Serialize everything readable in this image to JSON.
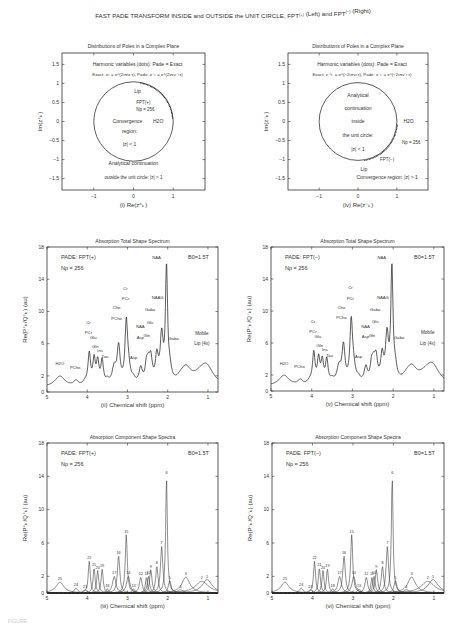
{
  "figure": {
    "title": "FAST PADE TRANSFORM INSIDE and OUTSIDE the UNIT CIRCLE, FPT",
    "title_sup_left": "(+)",
    "title_mid": " (Left) and FPT",
    "title_sup_right": "(−)",
    "title_end": " (Right)",
    "caption_stub": "FIGURE"
  },
  "chart_data": [
    {
      "id": "i",
      "type": "scatter",
      "title": "Distributions of Poles in a Complex Plane",
      "xlabel": "(i)  Re(z⁺ₖ)",
      "ylabel": "Im(z⁺ₖ)",
      "xlim": [
        -1.8,
        1.8
      ],
      "ylim": [
        -1.8,
        1.8
      ],
      "xticks": [
        "−1",
        "0",
        "1"
      ],
      "yticks": [
        "1.5",
        "1",
        "0.5",
        "0",
        "−0.5",
        "−1",
        "−1.5"
      ],
      "annotations": [
        "Harmonic variables (dots):  Pade = Exact",
        "Exact:  zₖ = e^(2iπνₖτ),  Pade:  z⁺ₖ = e^(2iπν⁺ₖτ)",
        "Lip",
        "FPT(+)",
        "Np = 256",
        "H2O",
        "Convergence",
        "region:",
        "|z| < 1",
        "Analytical continuation",
        "outside the unit circle: |z| > 1"
      ],
      "unit_circle": true,
      "poles_arc_deg": [
        5,
        80
      ]
    },
    {
      "id": "iv",
      "type": "scatter",
      "title": "Distributions of Poles in a Complex Plane",
      "xlabel": "(iv)  Re(z⁻ₖ)",
      "ylabel": "Im(z⁻ₖ)",
      "xlim": [
        -1.8,
        1.8
      ],
      "ylim": [
        -1.8,
        1.8
      ],
      "xticks": [
        "−1",
        "0",
        "1"
      ],
      "yticks": [
        "1.5",
        "1",
        "0.5",
        "0",
        "−0.5",
        "−1",
        "−1.5"
      ],
      "annotations": [
        "Harmonic variables (dots):  Pade = Exact",
        "Exact:  z⁻¹ₖ = e^(−2iπνₖτ),  Pade:  z⁻ₖ = e^(−2iπν⁻ₖτ)",
        "Analytical",
        "continuation",
        "inside",
        "the unit circle:",
        "|z| < 1",
        "H2O",
        "Np = 256",
        "FPT(−)",
        "Lip",
        "Convergence region: |z| > 1"
      ],
      "unit_circle": true,
      "poles_arc_deg": [
        -80,
        -5
      ]
    },
    {
      "id": "ii",
      "type": "line",
      "title": "Absorption Total Shape Spectrum",
      "xlabel": "(ii)  Chemical shift (ppm)",
      "ylabel": "Re(P⁺ₖ/Q⁺ₖ) (au)",
      "xlim": [
        5,
        0.75
      ],
      "ylim": [
        0,
        18
      ],
      "xticks": [
        "5",
        "4",
        "3",
        "2",
        "1"
      ],
      "yticks": [
        "18",
        "14",
        "10",
        "6",
        "2",
        "0"
      ],
      "legend_text": [
        "PADE: FPT(+)",
        "Np = 256",
        "B0=1.5T"
      ],
      "peak_labels": [
        "H2O",
        "PCho",
        "Cr PCr",
        "Glu",
        "Gln",
        "Ins",
        "Tau",
        "Cho PCho",
        "Cr PCr",
        "Asp",
        "NAA Asp",
        "Gln",
        "Glu",
        "Gaba",
        "NAAG",
        "NAA",
        "Gaba",
        "Mobile Lip (4x)"
      ],
      "x": [
        5.0,
        4.68,
        4.3,
        3.95,
        3.83,
        3.75,
        3.62,
        3.45,
        3.25,
        3.05,
        2.85,
        2.68,
        2.52,
        2.45,
        2.3,
        2.15,
        2.06,
        1.95,
        1.8,
        1.55,
        1.3,
        1.05,
        0.75
      ],
      "values": [
        1.2,
        2.2,
        1.9,
        5.6,
        5.0,
        4.6,
        4.9,
        3.3,
        7.6,
        9.9,
        3.0,
        4.8,
        5.7,
        5.8,
        6.8,
        10.5,
        17.8,
        5.6,
        3.3,
        4.0,
        3.2,
        4.2,
        2.2
      ]
    },
    {
      "id": "v",
      "type": "line",
      "title": "Absorption Total Shape Spectrum",
      "xlabel": "(v)  Chemical shift (ppm)",
      "ylabel": "Re(P⁻ₖ/Q⁻ₖ) (au)",
      "xlim": [
        5,
        0.75
      ],
      "ylim": [
        0,
        18
      ],
      "xticks": [
        "5",
        "4",
        "3",
        "2",
        "1"
      ],
      "yticks": [
        "18",
        "14",
        "10",
        "6",
        "2",
        "0"
      ],
      "legend_text": [
        "PADE: FPT(−)",
        "Np = 256",
        "B0=1.5T"
      ],
      "peak_labels": [
        "H2O",
        "PCho",
        "Cr PCr",
        "Glu",
        "Gln",
        "Ins",
        "Tau",
        "Cho PCho",
        "Cr PCr",
        "Asp",
        "NAA Asp",
        "Gln",
        "Glu",
        "Gaba",
        "NAAG",
        "NAA",
        "Gaba",
        "Mobile Lip (4x)"
      ],
      "x": [
        5.0,
        4.68,
        4.3,
        3.95,
        3.83,
        3.75,
        3.62,
        3.45,
        3.25,
        3.05,
        2.85,
        2.68,
        2.52,
        2.45,
        2.3,
        2.15,
        2.06,
        1.95,
        1.8,
        1.55,
        1.3,
        1.05,
        0.75
      ],
      "values": [
        1.2,
        2.2,
        1.9,
        5.6,
        5.0,
        4.6,
        4.9,
        3.3,
        7.6,
        9.9,
        3.0,
        4.8,
        5.7,
        5.8,
        6.8,
        10.5,
        17.8,
        5.6,
        3.3,
        4.0,
        3.2,
        4.2,
        2.2
      ]
    },
    {
      "id": "iii",
      "type": "line",
      "title": "Absorption Component Shape Spectra",
      "xlabel": "(iii)  Chemical shift (ppm)",
      "ylabel": "Re(P⁺ₖ/Q⁺ₖ) (au)",
      "xlim": [
        5,
        0.75
      ],
      "ylim": [
        0,
        18
      ],
      "xticks": [
        "5",
        "4",
        "3",
        "2",
        "1"
      ],
      "yticks": [
        "18",
        "14",
        "10",
        "6",
        "2",
        "0"
      ],
      "legend_text": [
        "PADE: FPT(+)",
        "Np = 256",
        "B0=1.5T"
      ],
      "components": [
        {
          "label": "25",
          "center": 4.68,
          "height": 1.3,
          "width": 0.12
        },
        {
          "label": "24",
          "center": 4.28,
          "height": 0.6,
          "width": 0.05
        },
        {
          "label": "23",
          "center": 4.05,
          "height": 0.4,
          "width": 0.05
        },
        {
          "label": "22",
          "center": 3.95,
          "height": 3.8,
          "width": 0.03
        },
        {
          "label": "21",
          "center": 3.83,
          "height": 3.0,
          "width": 0.03
        },
        {
          "label": "20",
          "center": 3.74,
          "height": 2.7,
          "width": 0.03
        },
        {
          "label": "19",
          "center": 3.63,
          "height": 2.9,
          "width": 0.03
        },
        {
          "label": "18",
          "center": 3.5,
          "height": 0.5,
          "width": 0.04
        },
        {
          "label": "17",
          "center": 3.33,
          "height": 2.0,
          "width": 0.05
        },
        {
          "label": "16",
          "center": 3.22,
          "height": 4.5,
          "width": 0.035
        },
        {
          "label": "15",
          "center": 3.03,
          "height": 7.0,
          "width": 0.03
        },
        {
          "label": "14",
          "center": 2.98,
          "height": 2.0,
          "width": 0.05
        },
        {
          "label": "13",
          "center": 2.85,
          "height": 0.5,
          "width": 0.04
        },
        {
          "label": "12",
          "center": 2.67,
          "height": 1.9,
          "width": 0.04
        },
        {
          "label": "11",
          "center": 2.53,
          "height": 1.9,
          "width": 0.03
        },
        {
          "label": "10",
          "center": 2.48,
          "height": 2.0,
          "width": 0.035
        },
        {
          "label": "9",
          "center": 2.42,
          "height": 2.8,
          "width": 0.035
        },
        {
          "label": "8",
          "center": 2.27,
          "height": 3.2,
          "width": 0.035
        },
        {
          "label": "7",
          "center": 2.15,
          "height": 5.6,
          "width": 0.035
        },
        {
          "label": "6",
          "center": 2.03,
          "height": 14.0,
          "width": 0.025
        },
        {
          "label": "5",
          "center": 1.95,
          "height": 1.5,
          "width": 0.04
        },
        {
          "label": "4",
          "center": 1.68,
          "height": 0.4,
          "width": 0.08
        },
        {
          "label": "3",
          "center": 1.55,
          "height": 1.9,
          "width": 0.12
        },
        {
          "label": "2",
          "center": 1.15,
          "height": 1.4,
          "width": 0.2
        },
        {
          "label": "1",
          "center": 1.02,
          "height": 1.6,
          "width": 0.15
        }
      ]
    },
    {
      "id": "vi",
      "type": "line",
      "title": "Absorption Component Shape Spectra",
      "xlabel": "(vi)  Chemical shift (ppm)",
      "ylabel": "Re(P⁻ₖ/Q⁻ₖ) (au)",
      "xlim": [
        5,
        0.75
      ],
      "ylim": [
        0,
        18
      ],
      "xticks": [
        "5",
        "4",
        "3",
        "2",
        "1"
      ],
      "yticks": [
        "18",
        "14",
        "10",
        "6",
        "2",
        "0"
      ],
      "legend_text": [
        "PADE: FPT(−)",
        "Np = 256",
        "B0=1.5T"
      ],
      "components": [
        {
          "label": "25",
          "center": 4.68,
          "height": 1.3,
          "width": 0.12
        },
        {
          "label": "24",
          "center": 4.28,
          "height": 0.6,
          "width": 0.05
        },
        {
          "label": "23",
          "center": 4.05,
          "height": 0.4,
          "width": 0.05
        },
        {
          "label": "22",
          "center": 3.95,
          "height": 3.8,
          "width": 0.03
        },
        {
          "label": "21",
          "center": 3.83,
          "height": 3.0,
          "width": 0.03
        },
        {
          "label": "20",
          "center": 3.74,
          "height": 2.7,
          "width": 0.03
        },
        {
          "label": "19",
          "center": 3.63,
          "height": 2.9,
          "width": 0.03
        },
        {
          "label": "18",
          "center": 3.5,
          "height": 0.5,
          "width": 0.04
        },
        {
          "label": "17",
          "center": 3.33,
          "height": 2.0,
          "width": 0.05
        },
        {
          "label": "16",
          "center": 3.22,
          "height": 4.5,
          "width": 0.035
        },
        {
          "label": "15",
          "center": 3.03,
          "height": 7.0,
          "width": 0.03
        },
        {
          "label": "14",
          "center": 2.98,
          "height": 2.0,
          "width": 0.05
        },
        {
          "label": "13",
          "center": 2.85,
          "height": 0.5,
          "width": 0.04
        },
        {
          "label": "12",
          "center": 2.67,
          "height": 1.9,
          "width": 0.04
        },
        {
          "label": "11",
          "center": 2.53,
          "height": 1.9,
          "width": 0.03
        },
        {
          "label": "10",
          "center": 2.48,
          "height": 2.0,
          "width": 0.035
        },
        {
          "label": "9",
          "center": 2.42,
          "height": 2.8,
          "width": 0.035
        },
        {
          "label": "8",
          "center": 2.27,
          "height": 3.2,
          "width": 0.035
        },
        {
          "label": "7",
          "center": 2.15,
          "height": 5.6,
          "width": 0.035
        },
        {
          "label": "6",
          "center": 2.03,
          "height": 14.0,
          "width": 0.025
        },
        {
          "label": "5",
          "center": 1.95,
          "height": 1.5,
          "width": 0.04
        },
        {
          "label": "4",
          "center": 1.68,
          "height": 0.4,
          "width": 0.08
        },
        {
          "label": "3",
          "center": 1.55,
          "height": 1.9,
          "width": 0.12
        },
        {
          "label": "2",
          "center": 1.15,
          "height": 1.4,
          "width": 0.2
        },
        {
          "label": "1",
          "center": 1.02,
          "height": 1.6,
          "width": 0.15
        }
      ]
    }
  ]
}
